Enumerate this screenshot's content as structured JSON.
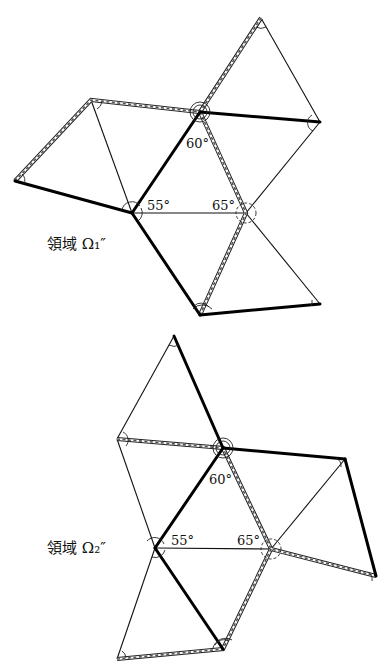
{
  "figures": [
    {
      "id": "omega1",
      "label": "領域 Ω₁″",
      "angles": {
        "top": "60°",
        "left": "55°",
        "right": "65°"
      }
    },
    {
      "id": "omega2",
      "label": "領域 Ω₂″",
      "angles": {
        "top": "60°",
        "left": "55°",
        "right": "65°"
      }
    }
  ]
}
